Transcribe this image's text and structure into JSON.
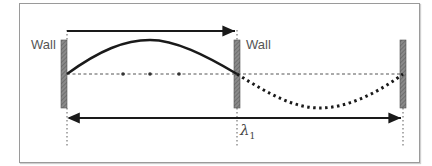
{
  "figure": {
    "labels": {
      "left_wall": "Wall",
      "middle_wall": "Wall",
      "wavelength": "λ",
      "wavelength_subscript": "1"
    },
    "colors": {
      "wave": "#1a1a1a",
      "wall_fill": "#7a7a7a",
      "frame": "#9a9a9a",
      "axis": "#555555"
    },
    "elements": [
      "solid half-wave between left and middle wall",
      "dotted inverted half-wave between middle and right wall",
      "dashed equilibrium axis with three dots",
      "top arrow spanning half wavelength",
      "bottom arrow spanning full wavelength λ1"
    ]
  }
}
